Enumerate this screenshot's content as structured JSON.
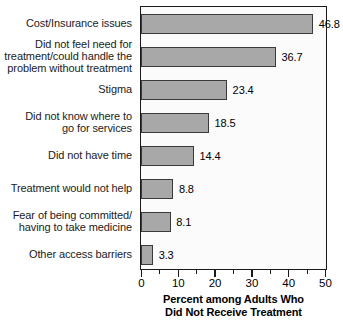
{
  "chart_data": {
    "type": "bar",
    "orientation": "horizontal",
    "title": "",
    "xlabel": "Percent among Adults Who\nDid Not Receive Treatment",
    "ylabel": "",
    "xlim": [
      0,
      50
    ],
    "xticks": [
      0,
      10,
      20,
      30,
      40,
      50
    ],
    "xtick_labels": [
      "0",
      "10",
      "20",
      "30",
      "40",
      "50"
    ],
    "minor_tick_step": 5,
    "grid": false,
    "legend": null,
    "bar_color": "#a8a8a8",
    "bar_edge_color": "#3a3a3a",
    "categories": [
      "Cost/Insurance issues",
      "Did not feel need for\ntreatment/could handle the\nproblem without treatment",
      "Stigma",
      "Did not know where to\ngo for services",
      "Did not have time",
      "Treatment would not help",
      "Fear of being committed/\nhaving to take medicine",
      "Other access barriers"
    ],
    "values": [
      46.8,
      36.7,
      23.4,
      18.5,
      14.4,
      8.8,
      8.1,
      3.3
    ],
    "value_labels": [
      "46.8",
      "36.7",
      "23.4",
      "18.5",
      "14.4",
      "8.8",
      "8.1",
      "3.3"
    ]
  }
}
